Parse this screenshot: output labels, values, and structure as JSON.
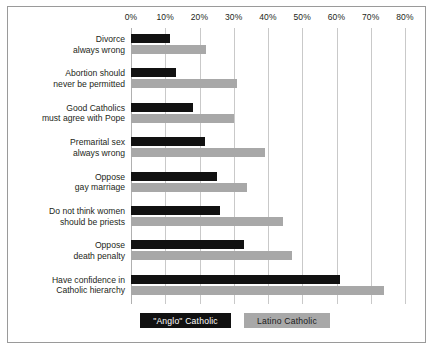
{
  "chart_data": {
    "type": "bar",
    "orientation": "horizontal",
    "title": "",
    "xlabel": "",
    "ylabel": "",
    "xlim": [
      0,
      80
    ],
    "xticks": [
      "0%",
      "10%",
      "20%",
      "30%",
      "40%",
      "50%",
      "60%",
      "70%",
      "80%"
    ],
    "xtick_values": [
      0,
      10,
      20,
      30,
      40,
      50,
      60,
      70,
      80
    ],
    "grid": true,
    "legend_position": "bottom",
    "categories": [
      "Divorce always wrong",
      "Abortion should never be permitted",
      "Good Catholics must agree with Pope",
      "Premarital sex always wrong",
      "Oppose gay marriage",
      "Do not think women should be priests",
      "Oppose death penalty",
      "Have confidence in Catholic hierarchy"
    ],
    "category_lines": [
      [
        "Divorce",
        "always wrong"
      ],
      [
        "Abortion should",
        "never be permitted"
      ],
      [
        "Good Catholics",
        "must agree with Pope"
      ],
      [
        "Premarital sex",
        "always wrong"
      ],
      [
        "Oppose",
        "gay marriage"
      ],
      [
        "Do not think women",
        "should be priests"
      ],
      [
        "Oppose",
        "death penalty"
      ],
      [
        "Have confidence in",
        "Catholic hierarchy"
      ]
    ],
    "series": [
      {
        "name": "\"Anglo\" Catholic",
        "color": "#111111",
        "values": [
          11.5,
          13,
          18,
          21.5,
          25,
          26,
          33,
          61
        ]
      },
      {
        "name": "Latino Catholic",
        "color": "#a8a8a8",
        "values": [
          22,
          31,
          30,
          39,
          34,
          44.5,
          47,
          74
        ]
      }
    ]
  },
  "legend": {
    "anglo_label": "\"Anglo\" Catholic",
    "latino_label": "Latino Catholic"
  }
}
